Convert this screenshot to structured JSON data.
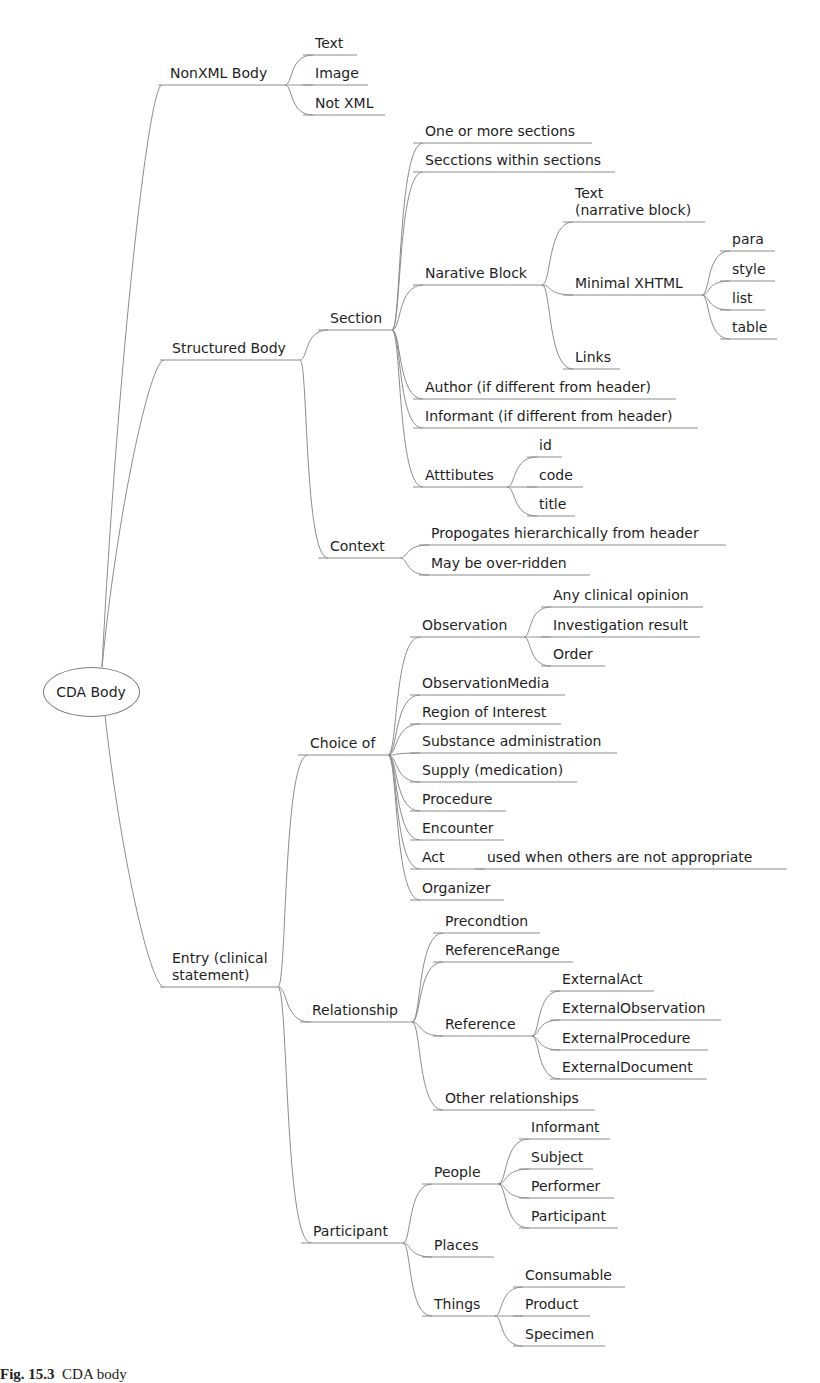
{
  "root": {
    "label": "CDA Body",
    "cx": 90,
    "cy": 691,
    "w": 95,
    "h": 48
  },
  "caption": {
    "prefix": "Fig. 15.3",
    "text": "CDA body"
  },
  "line_color": "#8c8c8c",
  "nodes": [
    {
      "id": "nonxml",
      "label": "NonXML Body",
      "x": 170,
      "y": 85,
      "x2": 285,
      "parent": "root"
    },
    {
      "id": "nx_text",
      "label": "Text",
      "x": 315,
      "y": 55,
      "x2": 357,
      "parent": "nonxml"
    },
    {
      "id": "nx_image",
      "label": "Image",
      "x": 315,
      "y": 85,
      "x2": 368,
      "parent": "nonxml"
    },
    {
      "id": "nx_notxml",
      "label": "Not XML",
      "x": 315,
      "y": 115,
      "x2": 385,
      "parent": "nonxml"
    },
    {
      "id": "structured",
      "label": "Structured Body",
      "x": 172,
      "y": 360,
      "x2": 300,
      "parent": "root"
    },
    {
      "id": "section",
      "label": "Section",
      "x": 330,
      "y": 330,
      "x2": 392,
      "parent": "structured"
    },
    {
      "id": "s_one",
      "label": "One or more sections",
      "x": 425,
      "y": 143,
      "x2": 592,
      "parent": "section"
    },
    {
      "id": "s_within",
      "label": "Secctions within sections",
      "x": 425,
      "y": 172,
      "x2": 615,
      "parent": "section"
    },
    {
      "id": "narrative",
      "label": "Narative Block",
      "x": 425,
      "y": 285,
      "x2": 542,
      "parent": "section"
    },
    {
      "id": "nb_text",
      "label": "Text\n(narrative block)",
      "x": 575,
      "y": 222,
      "x2": 705,
      "parent": "narrative",
      "multiline": true
    },
    {
      "id": "nb_xhtml",
      "label": "Minimal XHTML",
      "x": 575,
      "y": 295,
      "x2": 702,
      "parent": "narrative"
    },
    {
      "id": "x_para",
      "label": "para",
      "x": 732,
      "y": 251,
      "x2": 775,
      "parent": "nb_xhtml"
    },
    {
      "id": "x_style",
      "label": "style",
      "x": 732,
      "y": 281,
      "x2": 775,
      "parent": "nb_xhtml"
    },
    {
      "id": "x_list",
      "label": "list",
      "x": 732,
      "y": 310,
      "x2": 765,
      "parent": "nb_xhtml"
    },
    {
      "id": "x_table",
      "label": "table",
      "x": 732,
      "y": 339,
      "x2": 777,
      "parent": "nb_xhtml"
    },
    {
      "id": "nb_links",
      "label": "Links",
      "x": 575,
      "y": 369,
      "x2": 620,
      "parent": "narrative"
    },
    {
      "id": "s_author",
      "label": "Author (if different from header)",
      "x": 425,
      "y": 399,
      "x2": 676,
      "parent": "section"
    },
    {
      "id": "s_informant",
      "label": "Informant (if different from header)",
      "x": 425,
      "y": 428,
      "x2": 698,
      "parent": "section"
    },
    {
      "id": "attributes",
      "label": "Atttibutes",
      "x": 425,
      "y": 487,
      "x2": 507,
      "parent": "section"
    },
    {
      "id": "a_id",
      "label": "id",
      "x": 539,
      "y": 457,
      "x2": 562,
      "parent": "attributes"
    },
    {
      "id": "a_code",
      "label": "code",
      "x": 539,
      "y": 487,
      "x2": 583,
      "parent": "attributes"
    },
    {
      "id": "a_title",
      "label": "title",
      "x": 539,
      "y": 516,
      "x2": 575,
      "parent": "attributes"
    },
    {
      "id": "context",
      "label": "Context",
      "x": 330,
      "y": 558,
      "x2": 400,
      "parent": "structured"
    },
    {
      "id": "c_prop",
      "label": "Propogates hierarchically from header",
      "x": 431,
      "y": 545,
      "x2": 726,
      "parent": "context"
    },
    {
      "id": "c_over",
      "label": "May be over-ridden",
      "x": 431,
      "y": 575,
      "x2": 590,
      "parent": "context"
    },
    {
      "id": "entry",
      "label": "Entry (clinical\nstatement)",
      "x": 172,
      "y": 987,
      "x2": 278,
      "parent": "root",
      "multiline": true
    },
    {
      "id": "choice",
      "label": "Choice of",
      "x": 310,
      "y": 755,
      "x2": 388,
      "parent": "entry"
    },
    {
      "id": "observation",
      "label": "Observation",
      "x": 422,
      "y": 637,
      "x2": 524,
      "parent": "choice"
    },
    {
      "id": "o_opinion",
      "label": "Any clinical opinion",
      "x": 553,
      "y": 607,
      "x2": 703,
      "parent": "observation"
    },
    {
      "id": "o_result",
      "label": "Investigation result",
      "x": 553,
      "y": 637,
      "x2": 700,
      "parent": "observation"
    },
    {
      "id": "o_order",
      "label": "Order",
      "x": 553,
      "y": 666,
      "x2": 605,
      "parent": "observation"
    },
    {
      "id": "obsmedia",
      "label": "ObservationMedia",
      "x": 422,
      "y": 695,
      "x2": 565,
      "parent": "choice"
    },
    {
      "id": "roi",
      "label": "Region of Interest",
      "x": 422,
      "y": 724,
      "x2": 561,
      "parent": "choice"
    },
    {
      "id": "substance",
      "label": "Substance administration",
      "x": 422,
      "y": 753,
      "x2": 617,
      "parent": "choice"
    },
    {
      "id": "supply",
      "label": "Supply (medication)",
      "x": 422,
      "y": 782,
      "x2": 577,
      "parent": "choice"
    },
    {
      "id": "procedure",
      "label": "Procedure",
      "x": 422,
      "y": 811,
      "x2": 506,
      "parent": "choice"
    },
    {
      "id": "encounter",
      "label": "Encounter",
      "x": 422,
      "y": 840,
      "x2": 504,
      "parent": "choice"
    },
    {
      "id": "act",
      "label": "Act",
      "x": 422,
      "y": 869,
      "x2": 460,
      "parent": "choice"
    },
    {
      "id": "act_note",
      "label": "used when others are not appropriate",
      "x": 487,
      "y": 869,
      "x2": 787,
      "parent": "act"
    },
    {
      "id": "organizer",
      "label": "Organizer",
      "x": 422,
      "y": 900,
      "x2": 504,
      "parent": "choice"
    },
    {
      "id": "relationship",
      "label": "Relationship",
      "x": 312,
      "y": 1022,
      "x2": 412,
      "parent": "entry"
    },
    {
      "id": "r_precond",
      "label": "Precondtion",
      "x": 445,
      "y": 933,
      "x2": 540,
      "parent": "relationship"
    },
    {
      "id": "r_refrange",
      "label": "ReferenceRange",
      "x": 445,
      "y": 962,
      "x2": 573,
      "parent": "relationship"
    },
    {
      "id": "reference",
      "label": "Reference",
      "x": 445,
      "y": 1036,
      "x2": 532,
      "parent": "relationship"
    },
    {
      "id": "ref_act",
      "label": "ExternalAct",
      "x": 562,
      "y": 991,
      "x2": 654,
      "parent": "reference"
    },
    {
      "id": "ref_obs",
      "label": "ExternalObservation",
      "x": 562,
      "y": 1020,
      "x2": 721,
      "parent": "reference"
    },
    {
      "id": "ref_proc",
      "label": "ExternalProcedure",
      "x": 562,
      "y": 1050,
      "x2": 708,
      "parent": "reference"
    },
    {
      "id": "ref_doc",
      "label": "ExternalDocument",
      "x": 562,
      "y": 1079,
      "x2": 707,
      "parent": "reference"
    },
    {
      "id": "r_other",
      "label": "Other relationships",
      "x": 445,
      "y": 1110,
      "x2": 595,
      "parent": "relationship"
    },
    {
      "id": "participant",
      "label": "Participant",
      "x": 313,
      "y": 1243,
      "x2": 403,
      "parent": "entry"
    },
    {
      "id": "people",
      "label": "People",
      "x": 434,
      "y": 1184,
      "x2": 498,
      "parent": "participant"
    },
    {
      "id": "p_informant",
      "label": "Informant",
      "x": 531,
      "y": 1139,
      "x2": 610,
      "parent": "people"
    },
    {
      "id": "p_subject",
      "label": "Subject",
      "x": 531,
      "y": 1169,
      "x2": 593,
      "parent": "people"
    },
    {
      "id": "p_performer",
      "label": "Performer",
      "x": 531,
      "y": 1198,
      "x2": 614,
      "parent": "people"
    },
    {
      "id": "p_participant",
      "label": "Participant",
      "x": 531,
      "y": 1228,
      "x2": 618,
      "parent": "people"
    },
    {
      "id": "places",
      "label": "Places",
      "x": 434,
      "y": 1257,
      "x2": 494,
      "parent": "participant"
    },
    {
      "id": "things",
      "label": "Things",
      "x": 434,
      "y": 1316,
      "x2": 495,
      "parent": "participant"
    },
    {
      "id": "t_consumable",
      "label": "Consumable",
      "x": 525,
      "y": 1287,
      "x2": 625,
      "parent": "things"
    },
    {
      "id": "t_product",
      "label": "Product",
      "x": 525,
      "y": 1316,
      "x2": 590,
      "parent": "things"
    },
    {
      "id": "t_specimen",
      "label": "Specimen",
      "x": 525,
      "y": 1346,
      "x2": 605,
      "parent": "things"
    }
  ]
}
